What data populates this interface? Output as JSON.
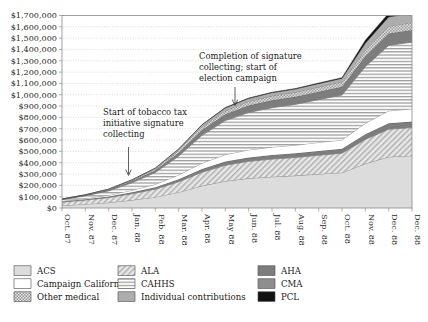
{
  "chart_data": {
    "type": "area",
    "title": "",
    "xlabel": "",
    "ylabel": "",
    "stacked": true,
    "grid": true,
    "legend_position": "bottom",
    "ylim": [
      0,
      1700000
    ],
    "ytick_step": 100000,
    "ytick_labels": [
      "$0",
      "$100,000",
      "$200,000",
      "$300,000",
      "$400,000",
      "$500,000",
      "$600,000",
      "$700,000",
      "$800,000",
      "$900,000",
      "$1,000,000",
      "$1,100,000",
      "$1,200,000",
      "$1,300,000",
      "$1,400,000",
      "$1,500,000",
      "$1,600,000",
      "$1,700,000"
    ],
    "categories": [
      "Oct. 87",
      "Nov. 87",
      "Dec. 87",
      "Jan. 88",
      "Feb. 88",
      "Mar. 88",
      "Apr. 88",
      "May 88",
      "Jun. 88",
      "Jul. 88",
      "Aug. 88",
      "Sep. 88",
      "Oct. 88",
      "Nov. 88",
      "Dec. 88",
      "Dec. 88"
    ],
    "series": [
      {
        "name": "ACS",
        "pattern": "solid-light-gray",
        "color": "#d9d9d9",
        "values": [
          22000,
          34000,
          48000,
          70000,
          96000,
          140000,
          196000,
          238000,
          262000,
          276000,
          286000,
          300000,
          312000,
          392000,
          452000,
          462000
        ]
      },
      {
        "name": "ALA",
        "pattern": "diagonal-hatch",
        "color": "#cfcfcf",
        "values": [
          30000,
          36000,
          44000,
          56000,
          70000,
          92000,
          120000,
          140000,
          150000,
          156000,
          160000,
          166000,
          172000,
          214000,
          244000,
          248000
        ]
      },
      {
        "name": "AHA",
        "pattern": "solid-dark-gray",
        "color": "#7d7d7d",
        "values": [
          6000,
          8000,
          10000,
          13000,
          17000,
          22000,
          28000,
          32000,
          34000,
          36000,
          37000,
          38000,
          39000,
          46000,
          52000,
          53000
        ]
      },
      {
        "name": "Campaign California",
        "pattern": "white",
        "color": "#ffffff",
        "values": [
          4000,
          7000,
          11000,
          18000,
          26000,
          38000,
          52000,
          62000,
          67000,
          70000,
          72000,
          75000,
          78000,
          96000,
          110000,
          112000
        ]
      },
      {
        "name": "CAHHS",
        "pattern": "horizontal-lines",
        "color": "#e4e4e4",
        "values": [
          12000,
          22000,
          38000,
          66000,
          104000,
          166000,
          246000,
          300000,
          330000,
          348000,
          360000,
          378000,
          396000,
          500000,
          578000,
          590000
        ]
      },
      {
        "name": "AHA-mid",
        "pattern": "solid-dark-gray",
        "color": "#7d7d7d",
        "values": [
          3000,
          5000,
          8000,
          13000,
          20000,
          31000,
          46000,
          56000,
          62000,
          65000,
          67000,
          70000,
          73000,
          92000,
          106000,
          108000
        ]
      },
      {
        "name": "Other medical",
        "pattern": "checkered",
        "color": "#bdbdbd",
        "values": [
          2000,
          3000,
          5000,
          8000,
          12000,
          19000,
          28000,
          34000,
          38000,
          40000,
          41000,
          43000,
          45000,
          56000,
          64000,
          66000
        ]
      },
      {
        "name": "Individual contributions",
        "pattern": "solid-medium-gray",
        "color": "#a8a8a8",
        "values": [
          1000,
          2000,
          3000,
          5000,
          8000,
          12000,
          18000,
          22000,
          24000,
          26000,
          27000,
          28000,
          29000,
          58000,
          80000,
          82000
        ]
      },
      {
        "name": "PCL",
        "pattern": "solid-black",
        "color": "#111111",
        "values": [
          0,
          0,
          0,
          0,
          0,
          1000,
          2000,
          3000,
          4000,
          5000,
          5000,
          6000,
          7000,
          28000,
          34000,
          35000
        ]
      }
    ],
    "annotations": [
      {
        "id": "annotation-signature-start",
        "text": [
          "Start of tobacco tax",
          "initiative signature",
          "collecting"
        ],
        "arrow": "down"
      },
      {
        "id": "annotation-campaign-start",
        "text": [
          "Completion of signature",
          "collecting; start of",
          "election campaign"
        ],
        "arrow": "down"
      }
    ],
    "legend": [
      {
        "label": "ACS",
        "pattern": "solid-light-gray"
      },
      {
        "label": "Campaign California",
        "pattern": "white"
      },
      {
        "label": "Other medical",
        "pattern": "checkered"
      },
      {
        "label": "ALA",
        "pattern": "diagonal-hatch"
      },
      {
        "label": "CAHHS",
        "pattern": "horizontal-lines"
      },
      {
        "label": "Individual contributions",
        "pattern": "solid-medium-gray"
      },
      {
        "label": "AHA",
        "pattern": "solid-dark-gray"
      },
      {
        "label": "CMA",
        "pattern": "solid-medium-dark-gray"
      },
      {
        "label": "PCL",
        "pattern": "solid-black"
      }
    ]
  }
}
